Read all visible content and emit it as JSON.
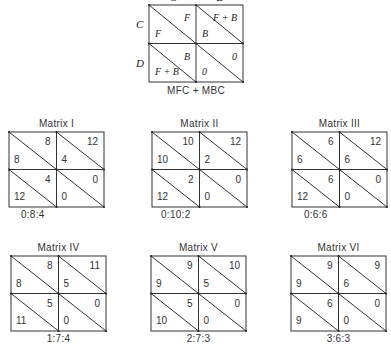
{
  "top_matrix": {
    "col_headers": [
      "C",
      "D"
    ],
    "row_headers": [
      "C",
      "D"
    ],
    "cells": [
      [
        {
          "upper": "F",
          "lower": "F"
        },
        {
          "upper": "F + B",
          "lower": "B"
        }
      ],
      [
        {
          "upper": "B",
          "lower": "F + B"
        },
        {
          "upper": "0",
          "lower": "0"
        }
      ]
    ],
    "caption": "MFC + MBC"
  },
  "matrices": [
    {
      "title": "Matrix I",
      "ratio": "0:8:4",
      "cells": [
        [
          {
            "upper": "8",
            "lower": "8"
          },
          {
            "upper": "12",
            "lower": "4"
          }
        ],
        [
          {
            "upper": "4",
            "lower": "12"
          },
          {
            "upper": "0",
            "lower": "0"
          }
        ]
      ]
    },
    {
      "title": "Matrix II",
      "ratio": "0:10:2",
      "cells": [
        [
          {
            "upper": "10",
            "lower": "10"
          },
          {
            "upper": "12",
            "lower": "2"
          }
        ],
        [
          {
            "upper": "2",
            "lower": "12"
          },
          {
            "upper": "0",
            "lower": "0"
          }
        ]
      ]
    },
    {
      "title": "Matrix III",
      "ratio": "0:6:6",
      "cells": [
        [
          {
            "upper": "6",
            "lower": "6"
          },
          {
            "upper": "12",
            "lower": "6"
          }
        ],
        [
          {
            "upper": "6",
            "lower": "12"
          },
          {
            "upper": "0",
            "lower": "0"
          }
        ]
      ]
    },
    {
      "title": "Matrix IV",
      "ratio": "1:7:4",
      "cells": [
        [
          {
            "upper": "8",
            "lower": "8"
          },
          {
            "upper": "11",
            "lower": "5"
          }
        ],
        [
          {
            "upper": "5",
            "lower": "11"
          },
          {
            "upper": "0",
            "lower": "0"
          }
        ]
      ]
    },
    {
      "title": "Matrix V",
      "ratio": "2:7:3",
      "cells": [
        [
          {
            "upper": "9",
            "lower": "9"
          },
          {
            "upper": "10",
            "lower": "5"
          }
        ],
        [
          {
            "upper": "5",
            "lower": "10"
          },
          {
            "upper": "0",
            "lower": "0"
          }
        ]
      ]
    },
    {
      "title": "Matrix VI",
      "ratio": "3:6:3",
      "cells": [
        [
          {
            "upper": "9",
            "lower": "9"
          },
          {
            "upper": "9",
            "lower": "6"
          }
        ],
        [
          {
            "upper": "6",
            "lower": "9"
          },
          {
            "upper": "0",
            "lower": "0"
          }
        ]
      ]
    }
  ]
}
